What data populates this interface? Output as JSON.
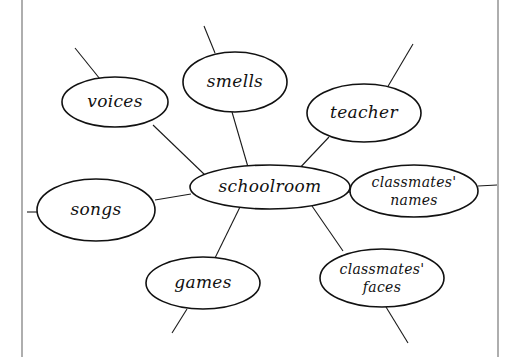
{
  "diagram": {
    "type": "cluster-map",
    "center": {
      "id": "schoolroom",
      "label": "schoolroom",
      "shape": {
        "cx": 270,
        "cy": 187,
        "rx": 80,
        "ry": 22
      }
    },
    "nodes": [
      {
        "id": "voices",
        "lines": [
          "voices"
        ],
        "shape": {
          "cx": 115,
          "cy": 102,
          "rx": 53,
          "ry": 25
        }
      },
      {
        "id": "smells",
        "lines": [
          "smells"
        ],
        "shape": {
          "cx": 235,
          "cy": 82,
          "rx": 52,
          "ry": 30
        }
      },
      {
        "id": "teacher",
        "lines": [
          "teacher"
        ],
        "shape": {
          "cx": 364,
          "cy": 113,
          "rx": 57,
          "ry": 29
        }
      },
      {
        "id": "classmates-names",
        "lines": [
          "classmates'",
          "names"
        ],
        "shape": {
          "cx": 414,
          "cy": 191,
          "rx": 64,
          "ry": 26
        }
      },
      {
        "id": "songs",
        "lines": [
          "songs"
        ],
        "shape": {
          "cx": 96,
          "cy": 210,
          "rx": 59,
          "ry": 31
        }
      },
      {
        "id": "games",
        "lines": [
          "games"
        ],
        "shape": {
          "cx": 203,
          "cy": 283,
          "rx": 57,
          "ry": 26
        }
      },
      {
        "id": "classmates-faces",
        "lines": [
          "classmates'",
          "faces"
        ],
        "shape": {
          "cx": 382,
          "cy": 278,
          "rx": 62,
          "ry": 29
        }
      }
    ],
    "edges": [
      {
        "from": "schoolroom",
        "to": "voices",
        "x1": 205,
        "y1": 175,
        "x2": 153,
        "y2": 125
      },
      {
        "from": "schoolroom",
        "to": "smells",
        "x1": 248,
        "y1": 167,
        "x2": 232,
        "y2": 112
      },
      {
        "from": "schoolroom",
        "to": "teacher",
        "x1": 296,
        "y1": 172,
        "x2": 329,
        "y2": 137
      },
      {
        "from": "schoolroom",
        "to": "classmates-names",
        "x1": 350,
        "y1": 192,
        "x2": 339,
        "y2": 192
      },
      {
        "from": "schoolroom",
        "to": "songs",
        "x1": 191,
        "y1": 194,
        "x2": 155,
        "y2": 200
      },
      {
        "from": "schoolroom",
        "to": "games",
        "x1": 240,
        "y1": 207,
        "x2": 215,
        "y2": 258
      },
      {
        "from": "schoolroom",
        "to": "classmates-faces",
        "x1": 312,
        "y1": 206,
        "x2": 343,
        "y2": 251
      }
    ],
    "stubs": [
      {
        "node": "voices",
        "x1": 100,
        "y1": 79,
        "x2": 75,
        "y2": 48
      },
      {
        "node": "smells",
        "x1": 215,
        "y1": 53,
        "x2": 204,
        "y2": 26
      },
      {
        "node": "teacher",
        "x1": 387,
        "y1": 88,
        "x2": 413,
        "y2": 44
      },
      {
        "node": "classmates-names",
        "x1": 478,
        "y1": 186,
        "x2": 497,
        "y2": 185
      },
      {
        "node": "songs",
        "x1": 37,
        "y1": 212,
        "x2": 27,
        "y2": 212
      },
      {
        "node": "games",
        "x1": 187,
        "y1": 309,
        "x2": 172,
        "y2": 333
      },
      {
        "node": "classmates-faces",
        "x1": 386,
        "y1": 307,
        "x2": 408,
        "y2": 343
      }
    ],
    "frame": {
      "left_x": 22,
      "right_x": 498,
      "color": "#9a9a9a"
    },
    "ink_color": "#111111",
    "background": "#ffffff"
  }
}
